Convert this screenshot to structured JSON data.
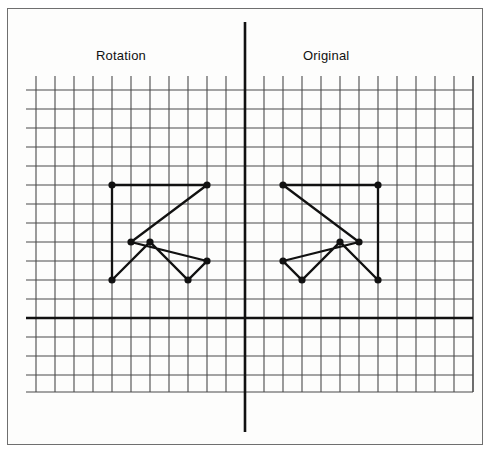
{
  "figure": {
    "title_left": "Rotation",
    "title_right": "Original",
    "background_color": "#ffffff",
    "frame_color": "#6f6f6f",
    "ink_color": "#111111",
    "grid_line_color": "#4a4a4a"
  },
  "chart_data": {
    "type": "scatter",
    "title": "",
    "subtitle": "",
    "xlabel": "",
    "ylabel": "",
    "grid": true,
    "grid_spacing": 1,
    "legend_position": "top",
    "axes": {
      "x_axis_visible": true,
      "y_axis_visible": true,
      "origin_label": "",
      "xlim": [
        -11.5,
        12
      ],
      "ylim": [
        -4,
        12.7
      ]
    },
    "annotations": [
      {
        "text": "Rotation",
        "x": -7.8,
        "y": 13.2
      },
      {
        "text": "Original",
        "x": 3.1,
        "y": 13.2
      }
    ],
    "series": [
      {
        "name": "Original",
        "marker": "filled-circle",
        "closed": true,
        "color": "#111111",
        "points": [
          {
            "x": 2,
            "y": 7
          },
          {
            "x": 6,
            "y": 4
          },
          {
            "x": 2,
            "y": 3
          },
          {
            "x": 3,
            "y": 2
          },
          {
            "x": 5,
            "y": 4
          },
          {
            "x": 7,
            "y": 2
          },
          {
            "x": 7,
            "y": 7
          }
        ]
      },
      {
        "name": "Rotation",
        "marker": "filled-circle",
        "closed": true,
        "color": "#111111",
        "points": [
          {
            "x": -2,
            "y": 7
          },
          {
            "x": -6,
            "y": 4
          },
          {
            "x": -2,
            "y": 3
          },
          {
            "x": -3,
            "y": 2
          },
          {
            "x": -5,
            "y": 4
          },
          {
            "x": -7,
            "y": 2
          },
          {
            "x": -7,
            "y": 7
          }
        ]
      }
    ]
  }
}
